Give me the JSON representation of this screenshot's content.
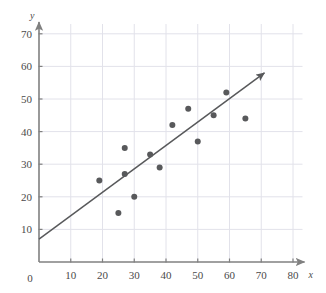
{
  "chart_data": {
    "type": "scatter",
    "title": "",
    "subtitle": "",
    "xlabel": "x",
    "ylabel": "y",
    "xlim": [
      0,
      83
    ],
    "ylim": [
      0,
      73
    ],
    "grid": true,
    "legend": null,
    "x_ticks": [
      0,
      10,
      20,
      30,
      40,
      50,
      60,
      70,
      80
    ],
    "y_ticks": [
      0,
      10,
      20,
      30,
      40,
      50,
      60,
      70
    ],
    "x_tick_labels": [
      "0",
      "10",
      "20",
      "30",
      "40",
      "50",
      "60",
      "70",
      "80"
    ],
    "y_tick_labels": [
      "0",
      "10",
      "20",
      "30",
      "40",
      "50",
      "60",
      "70"
    ],
    "origin_label": "0",
    "point_color": "#58595b",
    "line_color": "#58595b",
    "axis_color": "#808080",
    "grid_color": "#e2e2ea",
    "point_radius": 3,
    "series": [
      {
        "name": "observations",
        "marker": "filled-circle",
        "points": [
          {
            "x": 19,
            "y": 25
          },
          {
            "x": 25,
            "y": 15
          },
          {
            "x": 27,
            "y": 35
          },
          {
            "x": 27,
            "y": 27
          },
          {
            "x": 30,
            "y": 20
          },
          {
            "x": 35,
            "y": 33
          },
          {
            "x": 38,
            "y": 29
          },
          {
            "x": 42,
            "y": 42
          },
          {
            "x": 47,
            "y": 47
          },
          {
            "x": 50,
            "y": 37
          },
          {
            "x": 55,
            "y": 45
          },
          {
            "x": 59,
            "y": 52
          },
          {
            "x": 65,
            "y": 44
          }
        ]
      }
    ],
    "trend_line": {
      "name": "line-of-best-fit",
      "x_start": 0,
      "y_start": 7,
      "x_end": 71,
      "y_end": 58,
      "slope": 0.72,
      "intercept": 7,
      "arrow_end": true
    }
  }
}
